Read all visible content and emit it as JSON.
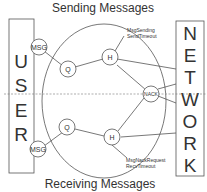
{
  "diagram": {
    "title_top": "Sending Messages",
    "title_bottom": "Receiving Messages",
    "user_box": {
      "letters": [
        "U",
        "S",
        "E",
        "R"
      ]
    },
    "network_box": {
      "letters": [
        "N",
        "E",
        "T",
        "W",
        "O",
        "R",
        "K"
      ]
    },
    "nodes": {
      "msg_top": "MSG",
      "msg_bottom": "MSG",
      "q_top": "Q",
      "q_bottom": "Q",
      "h_top": "H",
      "h_bottom": "H",
      "nack": "NACK"
    },
    "annotations": {
      "send_line1": "MsgSending",
      "send_line2": "SendTimeout",
      "recv_line1": "MsgNackRequest",
      "recv_line2": "RecvTimeout"
    },
    "colors": {
      "line": "#555555",
      "text": "#333333",
      "background": "#ffffff"
    }
  }
}
